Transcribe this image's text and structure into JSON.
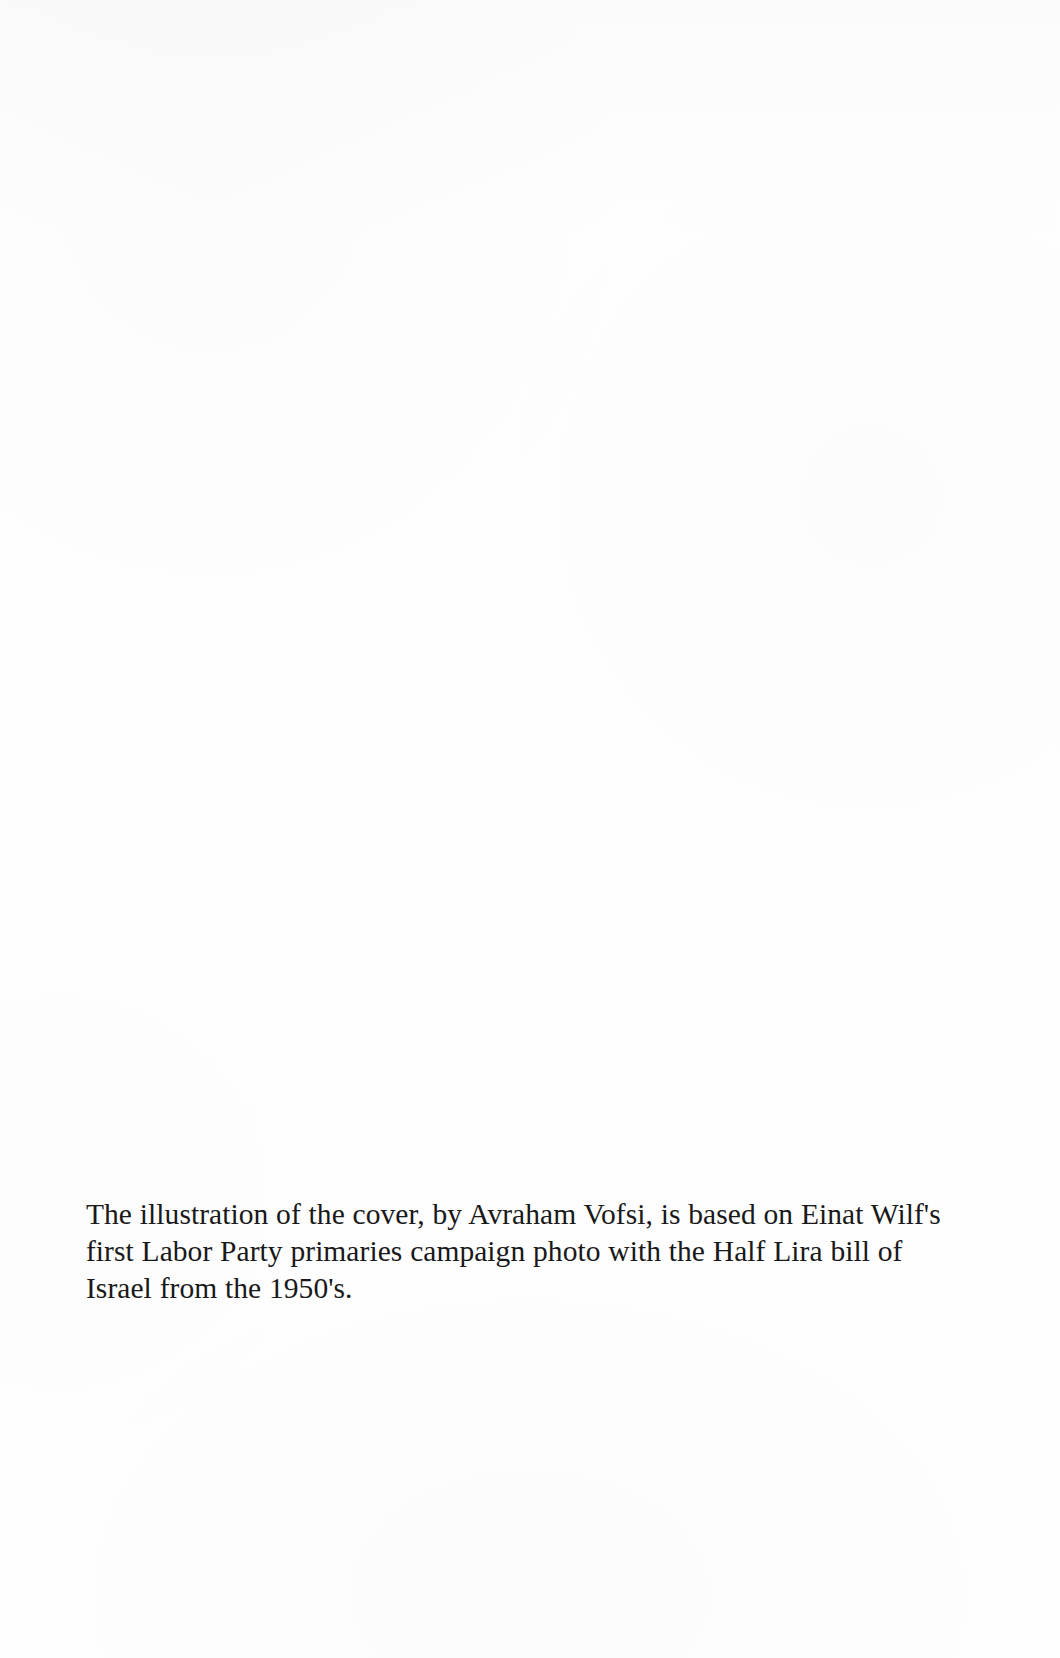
{
  "page": {
    "kind": "scanned-book-page",
    "width": 1060,
    "height": 1658,
    "background_color": "#fefefe",
    "text_color": "#191919"
  },
  "caption": {
    "full_text": "The illustration of the cover, by Avraham Vofsi, is based on Einat Wilf's first Labor Party primaries campaign photo with the Half Lira bill of Israel from the 1950's.",
    "lines": [
      "The illustration of the cover, by Avraham Vofsi, is based on Einat",
      "Wilf's first Labor Party primaries campaign photo with the Half",
      "Lira bill of Israel from the 1950's."
    ],
    "mentions": {
      "illustrator": "Avraham Vofsi",
      "subject": "Einat Wilf",
      "party": "Labor Party",
      "currency_note": "Half Lira bill of Israel",
      "decade": "1950's"
    }
  }
}
